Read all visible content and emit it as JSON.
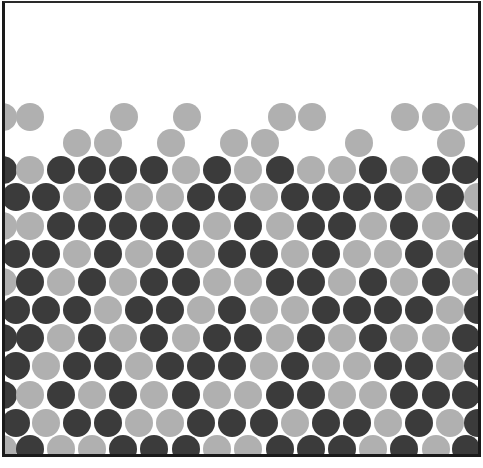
{
  "figure": {
    "title": "",
    "colors": {
      "dark": "#3b3b3b",
      "light": "#b0b0b0",
      "background": "#ffffff",
      "frame": "#1a1a1a"
    },
    "circle_diameter": 28,
    "frame": {
      "left": 2,
      "top": 1,
      "right": 477,
      "bottom": 455
    }
  },
  "loose_top_rows": [
    {
      "y": 117,
      "x": [
        3,
        30,
        124,
        187,
        282,
        312,
        405,
        436,
        466
      ],
      "type": "L"
    },
    {
      "y": 143,
      "x": [
        77,
        108,
        171,
        234,
        265,
        359,
        451
      ],
      "type": "L"
    }
  ],
  "packed_rows": [
    {
      "y": 170,
      "offset": "even",
      "pattern": "DLDDDDLDLDLLDLDD"
    },
    {
      "y": 197,
      "offset": "odd",
      "pattern": "DDLDLLDDLDDDDLDL"
    },
    {
      "y": 226,
      "offset": "even",
      "pattern": "LLDDDDDLDLDDLDLD"
    },
    {
      "y": 254,
      "offset": "odd",
      "pattern": "DDLDLDLDDLDLLDLD"
    },
    {
      "y": 282,
      "offset": "even",
      "pattern": "LDLDLDDLLDDLDLDL"
    },
    {
      "y": 310,
      "offset": "odd",
      "pattern": "DDDLDDLDLLDDDDLD"
    },
    {
      "y": 338,
      "offset": "even",
      "pattern": "DDLDLDLDDLDLDLLD"
    },
    {
      "y": 366,
      "offset": "odd",
      "pattern": "DLDDLDDDLDLLDDLD"
    },
    {
      "y": 395,
      "offset": "even",
      "pattern": "DLDLDLDLLDDLLDDD"
    },
    {
      "y": 423,
      "offset": "odd",
      "pattern": "DLDDLLDDDLDDLDLD"
    },
    {
      "y": 449,
      "offset": "even",
      "pattern": "LDLLDDDLLDDDLDLD"
    }
  ],
  "column_x": {
    "even": [
      3,
      30,
      61,
      92,
      123,
      154,
      186,
      217,
      248,
      280,
      311,
      342,
      373,
      404,
      436,
      466
    ],
    "odd": [
      16,
      46,
      77,
      108,
      139,
      170,
      201,
      232,
      264,
      295,
      326,
      357,
      388,
      419,
      450,
      478
    ]
  },
  "annotations": []
}
